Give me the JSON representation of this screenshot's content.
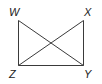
{
  "diagram": {
    "type": "geometry-figure",
    "points": {
      "W": {
        "label": "W",
        "x": 18.5,
        "y": 20.5
      },
      "X": {
        "label": "X",
        "x": 83.5,
        "y": 20.5
      },
      "Y": {
        "label": "Y",
        "x": 83.5,
        "y": 65.5
      },
      "Z": {
        "label": "Z",
        "x": 18.5,
        "y": 65.5
      }
    },
    "segments": [
      [
        "W",
        "Z"
      ],
      [
        "X",
        "Y"
      ],
      [
        "Z",
        "Y"
      ],
      [
        "W",
        "Y"
      ],
      [
        "X",
        "Z"
      ]
    ],
    "line_color": "#3a3a3a",
    "label_color": "#222222"
  }
}
